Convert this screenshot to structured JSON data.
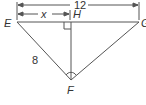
{
  "diagram": {
    "points": {
      "E": "E",
      "G": "G",
      "H": "H",
      "F": "F"
    },
    "labels": {
      "total": "12",
      "segment": "x",
      "side": "8"
    },
    "colors": {
      "line": "#555555",
      "text": "#333333"
    }
  }
}
